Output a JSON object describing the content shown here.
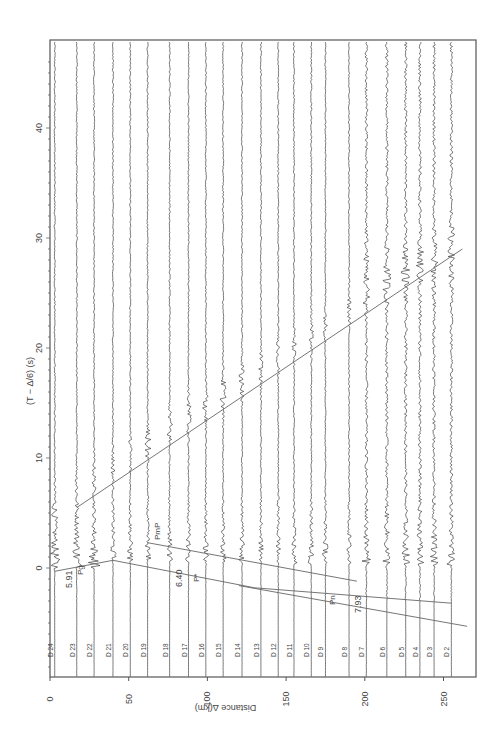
{
  "chart_data": {
    "type": "line",
    "title": "",
    "orientation": "rotated 90° (distance on horizontal, reduced time on vertical)",
    "xlabel": "Distance Δ(km)",
    "ylabel": "(T − Δ/6) (s)",
    "xlim": [
      0,
      270
    ],
    "ylim": [
      -10,
      47
    ],
    "x_ticks": [
      0,
      50,
      100,
      150,
      200,
      250
    ],
    "y_ticks": [
      0,
      10,
      20,
      30,
      40
    ],
    "grid": false,
    "stations": [
      {
        "name": "D 24",
        "distance": 3
      },
      {
        "name": "D 23",
        "distance": 17
      },
      {
        "name": "D 22",
        "distance": 28
      },
      {
        "name": "D 21",
        "distance": 40
      },
      {
        "name": "D 20",
        "distance": 51
      },
      {
        "name": "D 19",
        "distance": 62
      },
      {
        "name": "D 18",
        "distance": 76
      },
      {
        "name": "D 17",
        "distance": 88
      },
      {
        "name": "D 16",
        "distance": 99
      },
      {
        "name": "D 15",
        "distance": 110
      },
      {
        "name": "D 14",
        "distance": 122
      },
      {
        "name": "D 13",
        "distance": 134
      },
      {
        "name": "D 12",
        "distance": 145
      },
      {
        "name": "D 11",
        "distance": 155
      },
      {
        "name": "D 10",
        "distance": 166
      },
      {
        "name": "D 9",
        "distance": 175
      },
      {
        "name": "D 8",
        "distance": 190
      },
      {
        "name": "D 7",
        "distance": 201
      },
      {
        "name": "D 6",
        "distance": 214
      },
      {
        "name": "D 5",
        "distance": 226
      },
      {
        "name": "D 4",
        "distance": 235
      },
      {
        "name": "D 3",
        "distance": 244
      },
      {
        "name": "D 2",
        "distance": 255
      }
    ],
    "series": [
      {
        "name": "Pg",
        "velocity_label": "5.91",
        "points": [
          [
            3,
            -0.3
          ],
          [
            40,
            0.7
          ]
        ]
      },
      {
        "name": "P*",
        "velocity_label": "6.40",
        "points": [
          [
            40,
            0.7
          ],
          [
            130,
            -1.8
          ],
          [
            255,
            -3.2
          ]
        ]
      },
      {
        "name": "Pn",
        "velocity_label": "7.93",
        "points": [
          [
            120,
            -1.6
          ],
          [
            265,
            -5.3
          ]
        ]
      },
      {
        "name": "PmP",
        "velocity_label": "",
        "points": [
          [
            62,
            2.3
          ],
          [
            195,
            -1.2
          ]
        ]
      },
      {
        "name": "late phase",
        "velocity_label": "",
        "points": [
          [
            17,
            5.5
          ],
          [
            262,
            29
          ]
        ]
      }
    ],
    "annotations": [
      "5.91",
      "Pg",
      "6.40",
      "P*",
      "PmP",
      "Pn",
      "7.93"
    ]
  }
}
